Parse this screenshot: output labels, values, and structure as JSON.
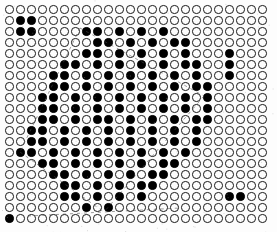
{
  "figure": {
    "background_color": "#fdfdfd",
    "dot_open_color": "#1a1a1a",
    "dot_filled_color": "#000000",
    "guide_line_color": "#4a4a4a"
  },
  "grid": {
    "columns": 24,
    "rows": 20,
    "cell_size_px": 11,
    "dot_diameter_px": 8.4,
    "origin_x_px": 4,
    "origin_y_px": 4,
    "legend": {
      "0": "open circle",
      "1": "filled black dot"
    },
    "matrix": [
      [
        0,
        0,
        0,
        0,
        0,
        0,
        0,
        0,
        0,
        0,
        0,
        0,
        0,
        0,
        0,
        0,
        0,
        0,
        0,
        0,
        0,
        0,
        0,
        0
      ],
      [
        0,
        1,
        1,
        0,
        0,
        0,
        0,
        0,
        0,
        0,
        0,
        0,
        0,
        0,
        0,
        0,
        0,
        0,
        0,
        0,
        0,
        0,
        0,
        0
      ],
      [
        0,
        1,
        1,
        0,
        0,
        0,
        0,
        1,
        1,
        0,
        1,
        0,
        1,
        0,
        1,
        0,
        0,
        0,
        0,
        0,
        0,
        0,
        0,
        0
      ],
      [
        0,
        0,
        0,
        0,
        0,
        0,
        0,
        0,
        1,
        1,
        0,
        1,
        0,
        1,
        0,
        1,
        1,
        0,
        0,
        0,
        0,
        0,
        0,
        0
      ],
      [
        0,
        0,
        0,
        0,
        0,
        0,
        0,
        1,
        1,
        0,
        1,
        0,
        1,
        0,
        1,
        0,
        1,
        0,
        0,
        0,
        1,
        0,
        0,
        0
      ],
      [
        0,
        0,
        0,
        0,
        0,
        1,
        1,
        0,
        1,
        0,
        1,
        0,
        1,
        0,
        1,
        0,
        1,
        1,
        0,
        0,
        1,
        0,
        0,
        0
      ],
      [
        0,
        0,
        0,
        0,
        1,
        1,
        0,
        1,
        0,
        1,
        0,
        1,
        0,
        1,
        0,
        1,
        0,
        1,
        0,
        0,
        1,
        0,
        0,
        0
      ],
      [
        0,
        0,
        0,
        0,
        1,
        1,
        0,
        1,
        0,
        1,
        0,
        1,
        0,
        1,
        0,
        1,
        0,
        1,
        1,
        0,
        0,
        0,
        0,
        0
      ],
      [
        0,
        0,
        0,
        1,
        1,
        0,
        1,
        0,
        1,
        0,
        1,
        0,
        1,
        0,
        1,
        0,
        1,
        0,
        1,
        0,
        0,
        0,
        0,
        0
      ],
      [
        0,
        0,
        0,
        1,
        1,
        0,
        1,
        0,
        1,
        0,
        1,
        0,
        1,
        0,
        1,
        0,
        1,
        0,
        1,
        0,
        0,
        0,
        0,
        0
      ],
      [
        0,
        0,
        0,
        1,
        1,
        0,
        1,
        0,
        1,
        1,
        0,
        1,
        0,
        1,
        0,
        1,
        0,
        1,
        1,
        0,
        0,
        0,
        0,
        0
      ],
      [
        0,
        0,
        1,
        1,
        0,
        1,
        0,
        1,
        0,
        1,
        0,
        1,
        0,
        1,
        0,
        1,
        0,
        1,
        0,
        0,
        0,
        0,
        0,
        0
      ],
      [
        0,
        0,
        1,
        1,
        0,
        1,
        0,
        1,
        0,
        1,
        0,
        1,
        0,
        1,
        0,
        1,
        0,
        1,
        0,
        0,
        0,
        0,
        0,
        0
      ],
      [
        0,
        1,
        1,
        0,
        1,
        0,
        1,
        0,
        1,
        0,
        1,
        0,
        1,
        0,
        1,
        0,
        1,
        0,
        0,
        0,
        0,
        0,
        0,
        0
      ],
      [
        0,
        0,
        0,
        1,
        1,
        0,
        1,
        0,
        1,
        0,
        1,
        0,
        1,
        0,
        1,
        1,
        0,
        0,
        0,
        0,
        0,
        0,
        0,
        0
      ],
      [
        0,
        0,
        0,
        0,
        1,
        1,
        0,
        1,
        0,
        1,
        0,
        1,
        0,
        1,
        1,
        0,
        0,
        0,
        0,
        0,
        0,
        0,
        0,
        0
      ],
      [
        0,
        0,
        0,
        0,
        0,
        1,
        1,
        0,
        1,
        0,
        1,
        0,
        1,
        1,
        0,
        0,
        0,
        0,
        0,
        0,
        0,
        0,
        0,
        0
      ],
      [
        0,
        0,
        0,
        0,
        0,
        1,
        1,
        0,
        1,
        0,
        1,
        0,
        1,
        0,
        0,
        0,
        0,
        0,
        0,
        0,
        1,
        1,
        0,
        0
      ],
      [
        0,
        0,
        0,
        0,
        0,
        0,
        0,
        1,
        0,
        1,
        0,
        0,
        0,
        0,
        0,
        0,
        0,
        0,
        0,
        0,
        0,
        0,
        0,
        0
      ],
      [
        1,
        0,
        0,
        0,
        0,
        0,
        0,
        0,
        0,
        0,
        0,
        0,
        0,
        0,
        0,
        0,
        0,
        0,
        0,
        0,
        0,
        0,
        0,
        0
      ]
    ]
  },
  "guides": {
    "note": "faint hand-drawn dashed lines tracing the diamond boundary",
    "segments": [
      {
        "name": "upper-left-edge",
        "x1": 80,
        "y1": 28,
        "x2": 20,
        "y2": 152
      },
      {
        "name": "upper-right-edge",
        "x1": 80,
        "y1": 28,
        "x2": 204,
        "y2": 96
      },
      {
        "name": "lower-left-edge",
        "x1": 20,
        "y1": 152,
        "x2": 104,
        "y2": 212
      },
      {
        "name": "lower-right-edge",
        "x1": 204,
        "y1": 96,
        "x2": 104,
        "y2": 212
      },
      {
        "name": "bottom-baseline",
        "x1": 28,
        "y1": 216,
        "x2": 180,
        "y2": 208
      }
    ]
  }
}
